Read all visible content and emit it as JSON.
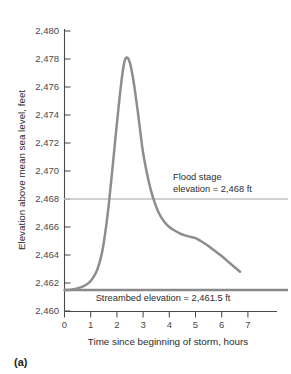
{
  "panel": {
    "label": "(a)"
  },
  "chart_data": {
    "type": "line",
    "title": "",
    "xlabel": "Time since beginning of storm, hours",
    "ylabel": "Elevation above mean sea level, feet",
    "xlim": [
      0,
      7.8
    ],
    "ylim": [
      2460,
      2480
    ],
    "grid": false,
    "legend_position": "none",
    "xticks": [
      0,
      1,
      2,
      3,
      4,
      5,
      6,
      7
    ],
    "xtick_labels": [
      "0",
      "1",
      "2",
      "3",
      "4",
      "5",
      "6",
      "7"
    ],
    "yticks": [
      2460,
      2462,
      2464,
      2466,
      2468,
      2470,
      2472,
      2474,
      2476,
      2478,
      2480
    ],
    "ytick_labels": [
      "2,460",
      "2,462",
      "2,464",
      "2,466",
      "2,468",
      "2,470",
      "2,472",
      "2,474",
      "2,476",
      "2,478",
      "2,480"
    ],
    "series": [
      {
        "name": "Stream surface elevation",
        "color": "#8d8d8d",
        "x": [
          0.0,
          0.15,
          0.35,
          0.55,
          0.75,
          0.95,
          1.1,
          1.25,
          1.4,
          1.5,
          1.6,
          1.7,
          1.8,
          1.9,
          2.0,
          2.1,
          2.2,
          2.3,
          2.4,
          2.5,
          2.6,
          2.7,
          2.8,
          2.9,
          3.0,
          3.15,
          3.3,
          3.45,
          3.6,
          3.8,
          4.0,
          4.2,
          4.4,
          4.6,
          4.8,
          5.0,
          5.2,
          5.45,
          5.7,
          5.95,
          6.2,
          6.45,
          6.7
        ],
        "y": [
          2461.5,
          2461.5,
          2461.55,
          2461.65,
          2461.8,
          2462.05,
          2462.4,
          2462.95,
          2463.9,
          2464.9,
          2466.2,
          2467.8,
          2469.6,
          2471.5,
          2473.4,
          2475.2,
          2476.8,
          2477.9,
          2478.1,
          2477.7,
          2476.8,
          2475.6,
          2474.2,
          2472.7,
          2471.3,
          2469.8,
          2468.6,
          2467.7,
          2467.0,
          2466.4,
          2466.0,
          2465.75,
          2465.55,
          2465.4,
          2465.3,
          2465.2,
          2465.0,
          2464.7,
          2464.35,
          2464.0,
          2463.6,
          2463.2,
          2462.8
        ]
      }
    ],
    "reference_lines": [
      {
        "name": "flood-stage",
        "value": 2468,
        "orientation": "horizontal",
        "color": "#c3c3c3",
        "label": [
          "Flood stage",
          "elevation = 2,468 ft"
        ],
        "label_text": "Flood stage elevation = 2,468 ft"
      },
      {
        "name": "streambed",
        "value": 2461.5,
        "orientation": "horizontal",
        "color": "#8a8a8a",
        "label": [
          "Streambed elevation = 2,461.5 ft"
        ],
        "label_text": "Streambed elevation = 2,461.5 ft"
      }
    ],
    "annotations": [
      {
        "name": "flood-stage-annotation",
        "lines": [
          "Flood stage",
          "elevation = 2,468 ft"
        ],
        "x": 4.2,
        "y": 2470.6
      },
      {
        "name": "streambed-annotation",
        "lines": [
          "Streambed elevation = 2,461.5 ft"
        ],
        "x": 3.6,
        "y": 2460.85
      }
    ],
    "peak": {
      "x": 2.35,
      "y": 2478.1
    },
    "baseline": 2461.5
  }
}
